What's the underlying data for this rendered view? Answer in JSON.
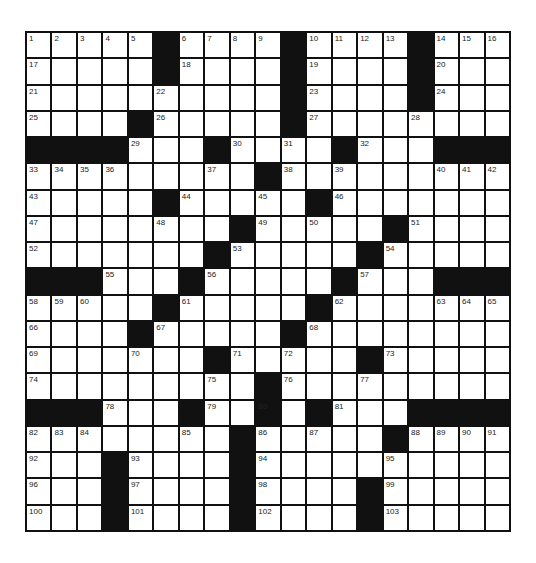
{
  "puzzle": {
    "rows": 19,
    "cols": 19,
    "grid": [
      ".....#....#....#...",
      ".....#....#....#...",
      "..........#....#...",
      "....#.....#........",
      "####...#....#...###",
      ".........#.........",
      ".....#.....#.......",
      "........#.....#....",
      ".......#.....#.....",
      "###...#.....#...###",
      ".....#.....#.......",
      "....#.....#........",
      ".......#.....#.....",
      ".........#.........",
      "###...#..#.#...####",
      "........#.....#....",
      "...#....#..........",
      "...#....#....#.....",
      "...#....#....#....."
    ],
    "numbers": [
      [
        0,
        0,
        1
      ],
      [
        0,
        1,
        2
      ],
      [
        0,
        2,
        3
      ],
      [
        0,
        3,
        4
      ],
      [
        0,
        4,
        5
      ],
      [
        0,
        6,
        6
      ],
      [
        0,
        7,
        7
      ],
      [
        0,
        8,
        8
      ],
      [
        0,
        9,
        9
      ],
      [
        0,
        11,
        10
      ],
      [
        0,
        12,
        11
      ],
      [
        0,
        13,
        12
      ],
      [
        0,
        14,
        13
      ],
      [
        0,
        16,
        14
      ],
      [
        0,
        17,
        15
      ],
      [
        0,
        18,
        16
      ],
      [
        1,
        0,
        17
      ],
      [
        1,
        6,
        18
      ],
      [
        1,
        11,
        19
      ],
      [
        1,
        16,
        20
      ],
      [
        2,
        0,
        21
      ],
      [
        2,
        5,
        22
      ],
      [
        2,
        11,
        23
      ],
      [
        2,
        16,
        24
      ],
      [
        3,
        0,
        25
      ],
      [
        3,
        5,
        26
      ],
      [
        3,
        11,
        27
      ],
      [
        3,
        15,
        28
      ],
      [
        4,
        4,
        29
      ],
      [
        4,
        8,
        30
      ],
      [
        4,
        10,
        31
      ],
      [
        4,
        13,
        32
      ],
      [
        5,
        0,
        33
      ],
      [
        5,
        1,
        34
      ],
      [
        5,
        2,
        35
      ],
      [
        5,
        3,
        36
      ],
      [
        5,
        7,
        37
      ],
      [
        5,
        10,
        38
      ],
      [
        5,
        12,
        39
      ],
      [
        5,
        16,
        40
      ],
      [
        5,
        17,
        41
      ],
      [
        5,
        18,
        42
      ],
      [
        6,
        0,
        43
      ],
      [
        6,
        6,
        44
      ],
      [
        6,
        9,
        45
      ],
      [
        6,
        12,
        46
      ],
      [
        7,
        0,
        47
      ],
      [
        7,
        5,
        48
      ],
      [
        7,
        9,
        49
      ],
      [
        7,
        11,
        50
      ],
      [
        7,
        15,
        51
      ],
      [
        8,
        0,
        52
      ],
      [
        8,
        8,
        53
      ],
      [
        8,
        14,
        54
      ],
      [
        9,
        3,
        55
      ],
      [
        9,
        7,
        56
      ],
      [
        9,
        13,
        57
      ],
      [
        10,
        0,
        58
      ],
      [
        10,
        1,
        59
      ],
      [
        10,
        2,
        60
      ],
      [
        10,
        6,
        61
      ],
      [
        10,
        12,
        62
      ],
      [
        10,
        16,
        63
      ],
      [
        10,
        17,
        64
      ],
      [
        10,
        18,
        65
      ],
      [
        11,
        0,
        66
      ],
      [
        11,
        5,
        67
      ],
      [
        11,
        11,
        68
      ],
      [
        12,
        0,
        69
      ],
      [
        12,
        4,
        70
      ],
      [
        12,
        8,
        71
      ],
      [
        12,
        10,
        72
      ],
      [
        12,
        14,
        73
      ],
      [
        13,
        0,
        74
      ],
      [
        13,
        7,
        75
      ],
      [
        13,
        10,
        76
      ],
      [
        13,
        13,
        77
      ],
      [
        14,
        3,
        78
      ],
      [
        14,
        7,
        79
      ],
      [
        14,
        9,
        80
      ],
      [
        14,
        12,
        81
      ],
      [
        15,
        0,
        82
      ],
      [
        15,
        1,
        83
      ],
      [
        15,
        2,
        84
      ],
      [
        15,
        6,
        85
      ],
      [
        15,
        9,
        86
      ],
      [
        15,
        11,
        87
      ],
      [
        15,
        15,
        88
      ],
      [
        15,
        16,
        89
      ],
      [
        15,
        17,
        90
      ],
      [
        15,
        18,
        91
      ],
      [
        16,
        0,
        92
      ],
      [
        16,
        4,
        93
      ],
      [
        16,
        9,
        94
      ],
      [
        16,
        14,
        95
      ],
      [
        17,
        0,
        96
      ],
      [
        17,
        4,
        97
      ],
      [
        17,
        9,
        98
      ],
      [
        17,
        14,
        99
      ],
      [
        18,
        0,
        100
      ],
      [
        18,
        4,
        101
      ],
      [
        18,
        9,
        102
      ],
      [
        18,
        14,
        103
      ]
    ],
    "colors": {
      "block": "#111111",
      "cell": "#ffffff",
      "number": "#222222"
    }
  }
}
